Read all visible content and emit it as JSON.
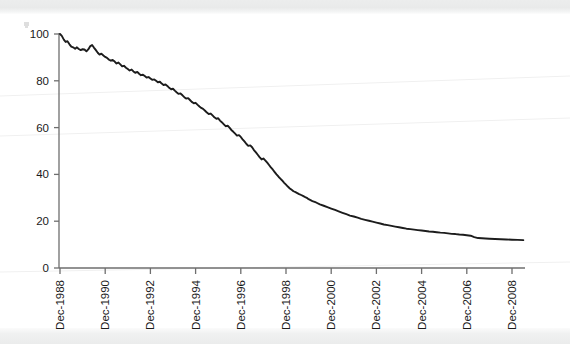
{
  "chart_data": {
    "type": "line",
    "title": "",
    "subtitle": "",
    "xlabel": "",
    "ylabel": "",
    "ylim": [
      0,
      100
    ],
    "yticks": [
      0,
      20,
      40,
      60,
      80,
      100
    ],
    "ytick_labels": [
      "0",
      "20",
      "40",
      "60",
      "80",
      "100"
    ],
    "xtick_labels": [
      "Dec-1988",
      "Dec-1990",
      "Dec-1992",
      "Dec-1994",
      "Dec-1996",
      "Dec-1998",
      "Dec-2000",
      "Dec-2002",
      "Dec-2004",
      "Dec-2006",
      "Dec-2008"
    ],
    "xtick_years": [
      1988,
      1990,
      1992,
      1994,
      1996,
      1998,
      2000,
      2002,
      2004,
      2006,
      2008
    ],
    "xlim_years": [
      1988,
      2008.6
    ],
    "grid": false,
    "legend": "none",
    "line_color": "#1c1c1c",
    "axis_color": "#6e6e6e",
    "tick_label_rotation_deg": -90,
    "series": [
      {
        "name": "index",
        "x": [
          1988.0,
          1988.08,
          1988.17,
          1988.25,
          1988.33,
          1988.42,
          1988.5,
          1988.58,
          1988.67,
          1988.75,
          1988.83,
          1988.92,
          1989.0,
          1989.08,
          1989.17,
          1989.25,
          1989.33,
          1989.42,
          1989.5,
          1989.58,
          1989.67,
          1989.75,
          1989.83,
          1989.92,
          1990.0,
          1990.08,
          1990.17,
          1990.25,
          1990.33,
          1990.42,
          1990.5,
          1990.58,
          1990.67,
          1990.75,
          1990.83,
          1990.92,
          1991.0,
          1991.08,
          1991.17,
          1991.25,
          1991.33,
          1991.42,
          1991.5,
          1991.58,
          1991.67,
          1991.75,
          1991.83,
          1991.92,
          1992.0,
          1992.08,
          1992.17,
          1992.25,
          1992.33,
          1992.42,
          1992.5,
          1992.58,
          1992.67,
          1992.75,
          1992.83,
          1992.92,
          1993.0,
          1993.08,
          1993.17,
          1993.25,
          1993.33,
          1993.42,
          1993.5,
          1993.58,
          1993.67,
          1993.75,
          1993.83,
          1993.92,
          1994.0,
          1994.08,
          1994.17,
          1994.25,
          1994.33,
          1994.42,
          1994.5,
          1994.58,
          1994.67,
          1994.75,
          1994.83,
          1994.92,
          1995.0,
          1995.08,
          1995.17,
          1995.25,
          1995.33,
          1995.42,
          1995.5,
          1995.58,
          1995.67,
          1995.75,
          1995.83,
          1995.92,
          1996.0,
          1996.08,
          1996.17,
          1996.25,
          1996.33,
          1996.42,
          1996.5,
          1996.58,
          1996.67,
          1996.75,
          1996.83,
          1996.92,
          1997.0,
          1997.08,
          1997.17,
          1997.25,
          1997.33,
          1997.42,
          1997.5,
          1997.58,
          1997.67,
          1997.75,
          1997.83,
          1997.92,
          1998.0,
          1998.08,
          1998.17,
          1998.25,
          1998.33,
          1998.42,
          1998.5,
          1998.58,
          1998.67,
          1998.75,
          1998.83,
          1998.92,
          1999.0,
          1999.17,
          1999.33,
          1999.5,
          1999.67,
          1999.83,
          2000.0,
          2000.17,
          2000.33,
          2000.5,
          2000.67,
          2000.83,
          2001.0,
          2001.17,
          2001.33,
          2001.5,
          2001.67,
          2001.83,
          2002.0,
          2002.17,
          2002.33,
          2002.5,
          2002.67,
          2002.83,
          2003.0,
          2003.17,
          2003.33,
          2003.5,
          2003.67,
          2003.83,
          2004.0,
          2004.17,
          2004.33,
          2004.5,
          2004.67,
          2004.83,
          2005.0,
          2005.17,
          2005.33,
          2005.5,
          2005.67,
          2005.83,
          2006.0,
          2006.17,
          2006.33,
          2006.5,
          2006.67,
          2006.83,
          2007.0,
          2007.25,
          2007.5,
          2007.75,
          2008.0,
          2008.25,
          2008.5
        ],
        "values": [
          100.0,
          99.2,
          97.6,
          96.6,
          96.9,
          95.6,
          94.6,
          94.3,
          93.7,
          94.3,
          93.6,
          93.1,
          93.5,
          93.4,
          92.6,
          93.4,
          94.7,
          95.3,
          94.2,
          93.2,
          92.0,
          91.2,
          91.6,
          90.8,
          90.2,
          89.8,
          89.0,
          88.6,
          88.9,
          88.2,
          87.4,
          87.8,
          87.0,
          86.2,
          86.4,
          85.6,
          85.0,
          84.4,
          84.8,
          84.0,
          83.4,
          83.8,
          83.0,
          82.4,
          82.6,
          82.0,
          81.4,
          81.6,
          81.0,
          80.4,
          80.6,
          80.0,
          79.4,
          79.6,
          78.8,
          78.2,
          78.4,
          77.8,
          77.0,
          76.4,
          76.6,
          75.8,
          75.0,
          74.4,
          74.6,
          73.8,
          73.0,
          72.4,
          72.6,
          71.8,
          71.0,
          70.4,
          70.6,
          69.8,
          69.0,
          68.4,
          68.0,
          67.2,
          66.4,
          65.8,
          66.0,
          65.2,
          64.4,
          63.8,
          64.0,
          63.0,
          62.2,
          61.4,
          60.6,
          60.8,
          60.0,
          59.0,
          58.2,
          57.4,
          56.6,
          56.8,
          56.0,
          55.0,
          54.0,
          53.0,
          52.2,
          52.4,
          51.6,
          50.4,
          49.4,
          48.4,
          47.4,
          46.4,
          46.8,
          46.0,
          45.0,
          44.0,
          43.0,
          42.0,
          41.0,
          40.0,
          39.0,
          38.2,
          37.4,
          36.4,
          35.6,
          34.8,
          34.0,
          33.4,
          32.8,
          32.4,
          32.0,
          31.6,
          31.2,
          30.8,
          30.4,
          30.0,
          29.4,
          28.6,
          28.0,
          27.2,
          26.6,
          26.0,
          25.4,
          24.8,
          24.2,
          23.6,
          23.0,
          22.4,
          22.0,
          21.5,
          21.0,
          20.6,
          20.2,
          19.8,
          19.4,
          19.0,
          18.6,
          18.3,
          18.0,
          17.7,
          17.4,
          17.1,
          16.8,
          16.6,
          16.4,
          16.2,
          16.0,
          15.8,
          15.6,
          15.5,
          15.3,
          15.1,
          15.0,
          14.8,
          14.6,
          14.5,
          14.3,
          14.2,
          14.0,
          13.8,
          13.2,
          12.8,
          12.7,
          12.6,
          12.5,
          12.4,
          12.3,
          12.2,
          12.1,
          12.0,
          11.9
        ]
      }
    ]
  },
  "geometry": {
    "plot_left_px": 59,
    "plot_right_px": 525,
    "y_zero_px": 268,
    "y_top_px": 34,
    "x_first_tick_px": 60,
    "x_tick_spacing_px": 45.2
  }
}
